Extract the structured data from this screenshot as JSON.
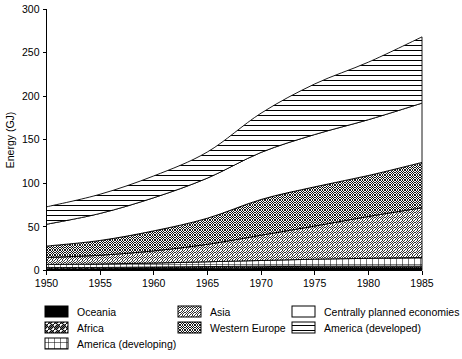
{
  "chart_data": {
    "type": "area",
    "title": "",
    "xlabel": "",
    "ylabel": "Energy (GJ)",
    "xlim": [
      1950,
      1985
    ],
    "ylim": [
      0,
      300
    ],
    "grid": false,
    "stacked": true,
    "legend_position": "bottom",
    "x": [
      1950,
      1955,
      1960,
      1965,
      1970,
      1975,
      1980,
      1985
    ],
    "xtick_labels": [
      "1950",
      "1955",
      "1960",
      "1965",
      "1970",
      "1975",
      "1980",
      "1985"
    ],
    "ytick_labels": [
      "0",
      "50",
      "100",
      "150",
      "200",
      "250",
      "300"
    ],
    "ytick_values": [
      0,
      50,
      100,
      150,
      200,
      250,
      300
    ],
    "series": [
      {
        "name": "Oceania",
        "pattern": "solid-black",
        "values": [
          2,
          2,
          2.5,
          2.5,
          3,
          3,
          3,
          3
        ]
      },
      {
        "name": "Africa",
        "pattern": "diagonal-forward",
        "values": [
          1.5,
          1.5,
          1.5,
          2,
          2,
          2,
          2,
          2
        ]
      },
      {
        "name": "America (developing)",
        "pattern": "grid",
        "values": [
          3.5,
          4,
          4.5,
          5.5,
          6.5,
          8,
          9,
          10
        ]
      },
      {
        "name": "Asia",
        "pattern": "diagonal-thin",
        "values": [
          8,
          10,
          14,
          20,
          29,
          38,
          48,
          57
        ]
      },
      {
        "name": "Western Europe",
        "pattern": "crosshatch",
        "values": [
          13,
          17,
          23,
          30,
          41,
          45,
          47,
          52
        ]
      },
      {
        "name": "Centrally planned economies",
        "pattern": "blank-white",
        "values": [
          25,
          31,
          38,
          46,
          54,
          60,
          64,
          68
        ]
      },
      {
        "name": "America (developed)",
        "pattern": "horizontal-lines",
        "values": [
          20,
          22,
          25,
          30,
          45,
          58,
          66,
          76
        ]
      }
    ],
    "cumulative_top": [
      73,
      87.5,
      108.5,
      136,
      180.5,
      214,
      239,
      268
    ]
  },
  "legend": {
    "columns": [
      [
        {
          "label": "Oceania",
          "pattern": "solid-black"
        },
        {
          "label": "Africa",
          "pattern": "diagonal-forward"
        },
        {
          "label": "America (developing)",
          "pattern": "grid"
        }
      ],
      [
        {
          "label": "Asia",
          "pattern": "diagonal-thin"
        },
        {
          "label": "Western Europe",
          "pattern": "crosshatch"
        }
      ],
      [
        {
          "label": "Centrally planned economies",
          "pattern": "blank-white"
        },
        {
          "label": "America (developed)",
          "pattern": "horizontal-lines"
        }
      ]
    ]
  },
  "colors": {
    "ink": "#000000",
    "background": "#ffffff"
  }
}
